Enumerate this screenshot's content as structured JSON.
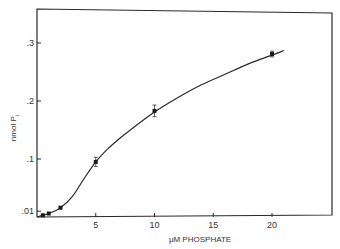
{
  "chart_data": {
    "type": "line",
    "title": "",
    "xlabel": "μM PHOSPHATE",
    "ylabel": "nmol P",
    "ylabel_subscript": "i",
    "xlim": [
      0,
      22.5
    ],
    "ylim": [
      0,
      0.34
    ],
    "x_ticks": [
      5,
      10,
      15,
      20
    ],
    "x_tick_labels": [
      "5",
      "10",
      "15",
      "20"
    ],
    "y_ticks": [
      0.01,
      0.1,
      0.2,
      0.3
    ],
    "y_tick_labels": [
      ".01",
      ".1",
      ".2",
      ".3"
    ],
    "grid": false,
    "legend": "none",
    "series": [
      {
        "name": "measured",
        "markers": true,
        "points": [
          {
            "x": 0.5,
            "y": 0.003,
            "err": 0.0
          },
          {
            "x": 1,
            "y": 0.006,
            "err": 0.0
          },
          {
            "x": 2,
            "y": 0.016,
            "err": 0.0
          },
          {
            "x": 5,
            "y": 0.095,
            "err": 0.008
          },
          {
            "x": 10,
            "y": 0.183,
            "err": 0.01
          },
          {
            "x": 20,
            "y": 0.281,
            "err": 0.005
          }
        ]
      },
      {
        "name": "fitted-curve",
        "markers": false,
        "x": [
          0,
          0.5,
          1,
          2,
          3,
          4,
          5,
          6,
          7,
          8,
          10,
          12,
          14,
          16,
          18,
          20,
          21
        ],
        "y": [
          0.0,
          0.003,
          0.006,
          0.016,
          0.035,
          0.066,
          0.095,
          0.117,
          0.135,
          0.151,
          0.181,
          0.206,
          0.228,
          0.246,
          0.264,
          0.279,
          0.287
        ]
      }
    ]
  }
}
